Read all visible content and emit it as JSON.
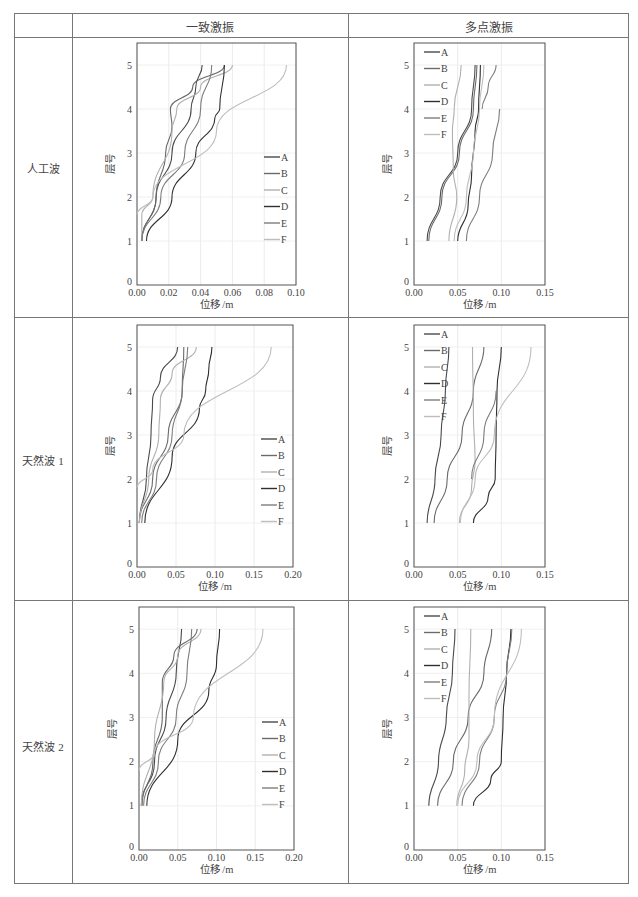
{
  "table": {
    "columns": [
      "",
      "一致激振",
      "多点激振"
    ],
    "rows": [
      "人工波",
      "天然波 1",
      "天然波 2"
    ]
  },
  "legend": [
    "A",
    "B",
    "C",
    "D",
    "E",
    "F"
  ],
  "series_colors": {
    "A": "#4a4a4a",
    "B": "#6a6a6a",
    "C": "#b0b0b0",
    "D": "#2f2f2f",
    "E": "#7d7d7d",
    "F": "#bdbdbd"
  },
  "chart_data": [
    {
      "type": "line",
      "title": "人工波 — 一致激振",
      "xlabel": "位移 /m",
      "ylabel": "层号",
      "xlim": [
        0,
        0.1
      ],
      "xticks": [
        "0.00",
        "0.02",
        "0.04",
        "0.06",
        "0.08",
        "0.10"
      ],
      "ylim": [
        0,
        5.5
      ],
      "yticks": [
        0,
        1,
        2,
        3,
        4,
        5
      ],
      "legend_position": "lower right",
      "grid": true,
      "series": [
        {
          "name": "A",
          "points": [
            [
              0.003,
              1
            ],
            [
              0.012,
              2
            ],
            [
              0.022,
              3
            ],
            [
              0.034,
              4
            ],
            [
              0.037,
              4.5
            ],
            [
              0.041,
              5
            ]
          ]
        },
        {
          "name": "B",
          "points": [
            [
              0.003,
              1
            ],
            [
              0.012,
              2
            ],
            [
              0.018,
              3
            ],
            [
              0.022,
              3.6
            ],
            [
              0.021,
              4
            ],
            [
              0.035,
              4.5
            ],
            [
              0.055,
              5
            ]
          ]
        },
        {
          "name": "C",
          "points": [
            [
              0.003,
              1
            ],
            [
              0.003,
              1.6
            ],
            [
              0.01,
              2
            ],
            [
              0.022,
              3.5
            ],
            [
              0.025,
              4
            ],
            [
              0.04,
              4.5
            ],
            [
              0.06,
              5
            ]
          ]
        },
        {
          "name": "D",
          "points": [
            [
              0.006,
              1
            ],
            [
              0.022,
              2
            ],
            [
              0.037,
              3
            ],
            [
              0.049,
              3.8
            ],
            [
              0.052,
              4
            ],
            [
              0.055,
              5
            ]
          ]
        },
        {
          "name": "E",
          "points": [
            [
              0.003,
              1
            ],
            [
              0.015,
              2
            ],
            [
              0.03,
              3
            ],
            [
              0.04,
              4
            ],
            [
              0.047,
              5
            ]
          ]
        },
        {
          "name": "F",
          "points": [
            [
              0,
              1.6
            ],
            [
              0.01,
              2
            ],
            [
              0.05,
              3.5
            ],
            [
              0.094,
              5
            ]
          ]
        }
      ]
    },
    {
      "type": "line",
      "title": "人工波 — 多点激振",
      "xlabel": "位移 /m",
      "ylabel": "层号",
      "xlim": [
        0,
        0.15
      ],
      "xticks": [
        "0.00",
        "0.05",
        "0.10",
        "0.15"
      ],
      "ylim": [
        0,
        5.5
      ],
      "yticks": [
        0,
        1,
        2,
        3,
        4,
        5
      ],
      "legend_position": "upper left",
      "grid": true,
      "series": [
        {
          "name": "A",
          "points": [
            [
              0.015,
              1
            ],
            [
              0.03,
              2
            ],
            [
              0.05,
              3
            ],
            [
              0.066,
              4
            ],
            [
              0.07,
              5
            ]
          ]
        },
        {
          "name": "B",
          "points": [
            [
              0.017,
              1
            ],
            [
              0.032,
              2
            ],
            [
              0.052,
              3
            ],
            [
              0.068,
              4
            ],
            [
              0.072,
              5
            ]
          ]
        },
        {
          "name": "C",
          "points": [
            [
              0.04,
              1
            ],
            [
              0.049,
              2
            ],
            [
              0.045,
              2.6
            ],
            [
              0.044,
              3.5
            ],
            [
              0.046,
              4
            ],
            [
              0.054,
              5
            ]
          ]
        },
        {
          "name": "D",
          "points": [
            [
              0.05,
              1
            ],
            [
              0.062,
              1.8
            ],
            [
              0.066,
              2.5
            ],
            [
              0.07,
              3.5
            ],
            [
              0.074,
              4
            ],
            [
              0.076,
              5
            ]
          ]
        },
        {
          "name": "E",
          "points": [
            [
              0.06,
              1
            ],
            [
              0.075,
              2
            ],
            [
              0.09,
              3
            ],
            [
              0.098,
              4
            ]
          ]
        },
        {
          "name": "F",
          "points": [
            [
              0.046,
              1
            ],
            [
              0.06,
              2
            ],
            [
              0.068,
              3
            ],
            [
              0.075,
              4
            ],
            [
              0.08,
              5
            ]
          ]
        },
        {
          "name": "E2",
          "points": [
            [
              0.078,
              4
            ],
            [
              0.085,
              4.5
            ],
            [
              0.094,
              5
            ]
          ]
        }
      ]
    },
    {
      "type": "line",
      "title": "天然波 1 — 一致激振",
      "xlabel": "位移 /m",
      "ylabel": "层号",
      "xlim": [
        0,
        0.2
      ],
      "xticks": [
        "0.00",
        "0.05",
        "0.10",
        "0.15",
        "0.20"
      ],
      "ylim": [
        0,
        5.5
      ],
      "yticks": [
        0,
        1,
        2,
        3,
        4,
        5
      ],
      "legend_position": "lower right",
      "grid": true,
      "series": [
        {
          "name": "A",
          "points": [
            [
              0.003,
              1
            ],
            [
              0.012,
              2
            ],
            [
              0.018,
              3
            ],
            [
              0.02,
              3.8
            ],
            [
              0.03,
              4.3
            ],
            [
              0.052,
              5
            ]
          ]
        },
        {
          "name": "B",
          "points": [
            [
              0.003,
              1
            ],
            [
              0.02,
              2
            ],
            [
              0.04,
              3
            ],
            [
              0.058,
              4
            ],
            [
              0.06,
              5
            ]
          ]
        },
        {
          "name": "C",
          "points": [
            [
              0.003,
              1
            ],
            [
              0.015,
              2
            ],
            [
              0.028,
              3
            ],
            [
              0.03,
              3.8
            ],
            [
              0.045,
              4.4
            ],
            [
              0.076,
              5
            ]
          ]
        },
        {
          "name": "D",
          "points": [
            [
              0.01,
              1
            ],
            [
              0.045,
              2.5
            ],
            [
              0.08,
              3.6
            ],
            [
              0.088,
              4
            ],
            [
              0.092,
              4.5
            ],
            [
              0.096,
              5
            ]
          ]
        },
        {
          "name": "E",
          "points": [
            [
              0.006,
              1
            ],
            [
              0.025,
              2
            ],
            [
              0.045,
              3
            ],
            [
              0.058,
              4
            ],
            [
              0.065,
              5
            ]
          ]
        },
        {
          "name": "F",
          "points": [
            [
              0,
              1.8
            ],
            [
              0.02,
              2.2
            ],
            [
              0.06,
              3
            ],
            [
              0.172,
              5
            ]
          ]
        }
      ]
    },
    {
      "type": "line",
      "title": "天然波 1 — 多点激振",
      "xlabel": "位移 /m",
      "ylabel": "层号",
      "xlim": [
        0,
        0.15
      ],
      "xticks": [
        "0.00",
        "0.05",
        "0.10",
        "0.15"
      ],
      "ylim": [
        0,
        5.5
      ],
      "yticks": [
        0,
        1,
        2,
        3,
        4,
        5
      ],
      "legend_position": "upper left",
      "grid": true,
      "series": [
        {
          "name": "A",
          "points": [
            [
              0.015,
              1
            ],
            [
              0.024,
              2
            ],
            [
              0.031,
              3
            ],
            [
              0.036,
              4
            ],
            [
              0.04,
              5
            ]
          ]
        },
        {
          "name": "B",
          "points": [
            [
              0.023,
              1
            ],
            [
              0.038,
              2
            ],
            [
              0.055,
              3
            ],
            [
              0.068,
              4
            ],
            [
              0.08,
              5
            ]
          ]
        },
        {
          "name": "C",
          "points": [
            [
              0.052,
              1
            ],
            [
              0.066,
              1.8
            ],
            [
              0.07,
              2.4
            ],
            [
              0.068,
              3.5
            ],
            [
              0.067,
              5
            ]
          ]
        },
        {
          "name": "D",
          "points": [
            [
              0.068,
              1
            ],
            [
              0.085,
              1.6
            ],
            [
              0.093,
              2
            ],
            [
              0.094,
              3
            ],
            [
              0.095,
              4
            ],
            [
              0.1,
              5
            ]
          ]
        },
        {
          "name": "E",
          "points": [
            [
              0.066,
              2
            ],
            [
              0.08,
              3
            ],
            [
              0.094,
              4
            ]
          ]
        },
        {
          "name": "F",
          "points": [
            [
              0.053,
              1
            ],
            [
              0.07,
              2
            ],
            [
              0.092,
              3
            ],
            [
              0.134,
              5
            ]
          ]
        }
      ]
    },
    {
      "type": "line",
      "title": "天然波 2 — 一致激振",
      "xlabel": "位移 /m",
      "ylabel": "层号",
      "xlim": [
        0,
        0.2
      ],
      "xticks": [
        "0.00",
        "0.05",
        "0.10",
        "0.15",
        "0.20"
      ],
      "ylim": [
        0,
        5.5
      ],
      "yticks": [
        0,
        1,
        2,
        3,
        4,
        5
      ],
      "legend_position": "lower right",
      "grid": true,
      "series": [
        {
          "name": "A",
          "points": [
            [
              0.003,
              1
            ],
            [
              0.02,
              2
            ],
            [
              0.035,
              3
            ],
            [
              0.048,
              4
            ],
            [
              0.055,
              5
            ]
          ]
        },
        {
          "name": "B",
          "points": [
            [
              0.004,
              1
            ],
            [
              0.018,
              2
            ],
            [
              0.03,
              3
            ],
            [
              0.03,
              3.8
            ],
            [
              0.045,
              4.4
            ],
            [
              0.075,
              5
            ]
          ]
        },
        {
          "name": "C",
          "points": [
            [
              0.003,
              1
            ],
            [
              0.02,
              2.5
            ],
            [
              0.032,
              3.8
            ],
            [
              0.05,
              4.4
            ],
            [
              0.08,
              5
            ]
          ]
        },
        {
          "name": "D",
          "points": [
            [
              0.01,
              1
            ],
            [
              0.05,
              2.5
            ],
            [
              0.09,
              3.6
            ],
            [
              0.1,
              4.2
            ],
            [
              0.104,
              5
            ]
          ]
        },
        {
          "name": "E",
          "points": [
            [
              0.006,
              1
            ],
            [
              0.025,
              2
            ],
            [
              0.048,
              3
            ],
            [
              0.062,
              4
            ],
            [
              0.068,
              5
            ]
          ]
        },
        {
          "name": "F",
          "points": [
            [
              0,
              1.8
            ],
            [
              0.02,
              2.2
            ],
            [
              0.07,
              3
            ],
            [
              0.16,
              5
            ]
          ]
        }
      ]
    },
    {
      "type": "line",
      "title": "天然波 2 — 多点激振",
      "xlabel": "位移 /m",
      "ylabel": "层号",
      "xlim": [
        0,
        0.15
      ],
      "xticks": [
        "0.00",
        "0.05",
        "0.10",
        "0.15"
      ],
      "ylim": [
        0,
        5.5
      ],
      "yticks": [
        0,
        1,
        2,
        3,
        4,
        5
      ],
      "legend_position": "upper left",
      "grid": true,
      "series": [
        {
          "name": "A",
          "points": [
            [
              0.017,
              1
            ],
            [
              0.028,
              2
            ],
            [
              0.037,
              3
            ],
            [
              0.044,
              4
            ],
            [
              0.047,
              5
            ]
          ]
        },
        {
          "name": "B",
          "points": [
            [
              0.027,
              1
            ],
            [
              0.045,
              2
            ],
            [
              0.062,
              3
            ],
            [
              0.08,
              4
            ],
            [
              0.089,
              5
            ]
          ]
        },
        {
          "name": "C",
          "points": [
            [
              0.049,
              1
            ],
            [
              0.058,
              1.8
            ],
            [
              0.063,
              2.5
            ],
            [
              0.063,
              3.5
            ],
            [
              0.065,
              5
            ]
          ]
        },
        {
          "name": "D",
          "points": [
            [
              0.068,
              1
            ],
            [
              0.088,
              1.6
            ],
            [
              0.1,
              2
            ],
            [
              0.102,
              3
            ],
            [
              0.106,
              4
            ],
            [
              0.111,
              5
            ]
          ]
        },
        {
          "name": "E",
          "points": [
            [
              0.055,
              1
            ],
            [
              0.075,
              2
            ],
            [
              0.092,
              3
            ],
            [
              0.106,
              4
            ],
            [
              0.112,
              5
            ]
          ]
        },
        {
          "name": "F",
          "points": [
            [
              0.05,
              1
            ],
            [
              0.072,
              2
            ],
            [
              0.092,
              3
            ],
            [
              0.123,
              5
            ]
          ]
        }
      ]
    }
  ]
}
